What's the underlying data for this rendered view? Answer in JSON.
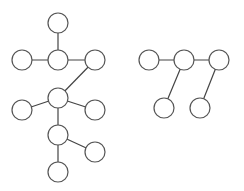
{
  "diagram": {
    "type": "graph",
    "style": {
      "node_radius": 10,
      "node_fill": "#ffffff",
      "node_stroke": "#555555",
      "edge_stroke": "#444444",
      "background": "#ffffff"
    },
    "graphs": [
      {
        "name": "left-tree",
        "nodes": [
          {
            "id": "A",
            "x": 58,
            "y": 23
          },
          {
            "id": "B",
            "x": 22,
            "y": 60
          },
          {
            "id": "C",
            "x": 58,
            "y": 60
          },
          {
            "id": "D",
            "x": 95,
            "y": 60
          },
          {
            "id": "E",
            "x": 58,
            "y": 98
          },
          {
            "id": "F",
            "x": 22,
            "y": 110
          },
          {
            "id": "G",
            "x": 95,
            "y": 110
          },
          {
            "id": "H",
            "x": 58,
            "y": 135
          },
          {
            "id": "I",
            "x": 95,
            "y": 152
          },
          {
            "id": "J",
            "x": 58,
            "y": 172
          }
        ],
        "edges": [
          [
            "A",
            "C"
          ],
          [
            "B",
            "C"
          ],
          [
            "C",
            "D"
          ],
          [
            "D",
            "E"
          ],
          [
            "E",
            "F"
          ],
          [
            "E",
            "G"
          ],
          [
            "E",
            "H"
          ],
          [
            "H",
            "I"
          ],
          [
            "H",
            "J"
          ]
        ]
      },
      {
        "name": "right-tree",
        "nodes": [
          {
            "id": "K",
            "x": 149,
            "y": 60
          },
          {
            "id": "L",
            "x": 184,
            "y": 60
          },
          {
            "id": "M",
            "x": 219,
            "y": 60
          },
          {
            "id": "N",
            "x": 164,
            "y": 108
          },
          {
            "id": "O",
            "x": 200,
            "y": 108
          }
        ],
        "edges": [
          [
            "K",
            "L"
          ],
          [
            "L",
            "M"
          ],
          [
            "L",
            "N"
          ],
          [
            "M",
            "O"
          ]
        ]
      }
    ]
  }
}
